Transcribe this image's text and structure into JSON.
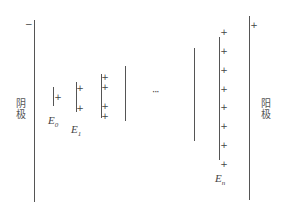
{
  "diagram": {
    "title": "",
    "cathode": {
      "label": "阴极",
      "sign": "−"
    },
    "anode": {
      "label": "阳极",
      "sign": "+"
    },
    "ellipsis": "···",
    "plates": [
      {
        "id": "E0",
        "label_main": "E",
        "label_sub": "0",
        "plus_count": 1
      },
      {
        "id": "E1",
        "label_main": "E",
        "label_sub": "1",
        "plus_count": 2
      },
      {
        "id": "E2",
        "label_main": "",
        "label_sub": "",
        "plus_count": 4
      },
      {
        "id": "E3",
        "label_main": "",
        "label_sub": "",
        "plus_count": 0
      },
      {
        "id": "E_n-1",
        "label_main": "",
        "label_sub": "",
        "plus_count": 0
      },
      {
        "id": "En",
        "label_main": "E",
        "label_sub": "n",
        "plus_count": 8
      }
    ],
    "plus_glyph": "+"
  }
}
